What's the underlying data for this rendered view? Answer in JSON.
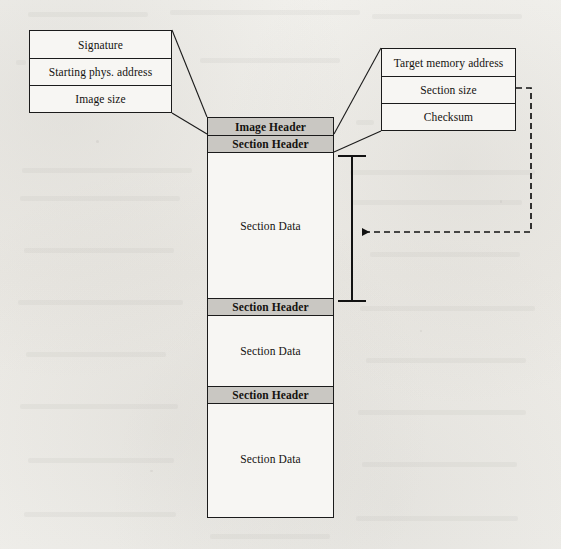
{
  "diagram": {
    "colors": {
      "background": "#efeeea",
      "stroke": "#1b1b1b",
      "header_fill": "#c9c7c2",
      "body_fill": "#f7f6f3"
    },
    "image_header_detail": {
      "name": "image-header-fields",
      "fields": [
        {
          "label": "Signature"
        },
        {
          "label": "Starting phys. address"
        },
        {
          "label": "Image size"
        }
      ]
    },
    "section_header_detail": {
      "name": "section-header-fields",
      "fields": [
        {
          "label": "Target memory address"
        },
        {
          "label": "Section size"
        },
        {
          "label": "Checksum"
        }
      ]
    },
    "image_layout": {
      "name": "firmware-image-stack",
      "rows": [
        {
          "label": "Image Header",
          "kind": "header"
        },
        {
          "label": "Section Header",
          "kind": "header"
        },
        {
          "label": "Section Data",
          "kind": "data"
        },
        {
          "label": "Section Header",
          "kind": "header"
        },
        {
          "label": "Section Data",
          "kind": "data"
        },
        {
          "label": "Section Header",
          "kind": "header"
        },
        {
          "label": "Section Data",
          "kind": "data"
        }
      ]
    },
    "annotations": {
      "size_bracket": {
        "name": "section-size-bracket",
        "describes": "Section Data",
        "linked_field": "Section size"
      },
      "size_arrow": {
        "name": "section-size-arrow",
        "style": "dashed",
        "direction": "left"
      }
    }
  }
}
